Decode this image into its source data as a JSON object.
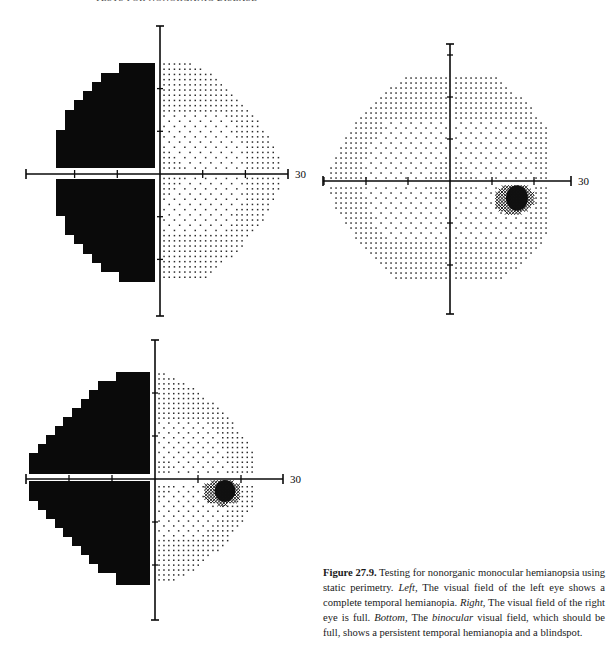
{
  "running_head": "TESTS FOR NONORGANIC DISEASE",
  "figure": {
    "number_label": "Figure 27.9.",
    "caption_parts": [
      {
        "text": " Testing for nonorganic monocular hemianopsia using static perimetry. ",
        "style": "normal"
      },
      {
        "text": "Left,",
        "style": "italic"
      },
      {
        "text": " The visual field of the left eye shows a complete temporal hemianopia. ",
        "style": "normal"
      },
      {
        "text": "Right,",
        "style": "italic"
      },
      {
        "text": " The visual field of the right eye is full. ",
        "style": "normal"
      },
      {
        "text": "Bottom,",
        "style": "italic"
      },
      {
        "text": " The ",
        "style": "normal"
      },
      {
        "text": "binocular",
        "style": "italic"
      },
      {
        "text": " visual field, which should be full, shows a persistent temporal hemianopia and a blindspot.",
        "style": "normal"
      }
    ]
  },
  "panels": [
    {
      "id": "left-eye",
      "title": "Left",
      "description": "Left eye visual field — complete temporal hemianopia",
      "center": [
        160,
        174
      ],
      "deg_px": 4.27,
      "axis_extent_px": {
        "left": 134,
        "right": 128,
        "top": 148,
        "bottom": 142
      },
      "axis_label": "30",
      "axis_label_pos": [
        295,
        178
      ],
      "ticks_deg": [
        -20,
        -10,
        10,
        20
      ],
      "defect": {
        "side": "left",
        "right_edge_x": 155,
        "upper_steps": [
          [
            63,
            73,
            119
          ],
          [
            73,
            82,
            101
          ],
          [
            82,
            91,
            92
          ],
          [
            91,
            100,
            83
          ],
          [
            100,
            110,
            74
          ],
          [
            110,
            130,
            65
          ],
          [
            130,
            168,
            56
          ]
        ],
        "lower_steps": [
          [
            179,
            216,
            56
          ],
          [
            216,
            235,
            65
          ],
          [
            235,
            244,
            74
          ],
          [
            244,
            254,
            83
          ],
          [
            254,
            263,
            92
          ],
          [
            263,
            272,
            101
          ],
          [
            272,
            282,
            119
          ]
        ]
      },
      "seeing_field": {
        "x_min": 164,
        "x_max": 282,
        "y_min": 64,
        "y_max": 280,
        "spacing": 5.2,
        "radius_px": 124
      },
      "blindspot": null
    },
    {
      "id": "right-eye",
      "title": "Right",
      "description": "Right eye visual field — full",
      "center": [
        450,
        181
      ],
      "deg_px": 4.2,
      "axis_extent_px": {
        "left": 127,
        "right": 121,
        "top": 137,
        "bottom": 133
      },
      "axis_label": "30",
      "axis_label_pos": [
        578,
        185
      ],
      "ticks_deg": [
        -30,
        -20,
        -10,
        10,
        20
      ],
      "defect": null,
      "seeing_field": {
        "x_min": 326,
        "x_max": 546,
        "y_min": 78,
        "y_max": 281,
        "spacing": 5.0,
        "radius_px": 124
      },
      "blindspot": {
        "cx": 514,
        "cy": 199,
        "rx": 20,
        "ry": 15
      }
    },
    {
      "id": "binocular",
      "title": "Bottom",
      "description": "Binocular visual field — persistent temporal hemianopia and blindspot",
      "center": [
        155,
        479
      ],
      "deg_px": 4.3,
      "axis_extent_px": {
        "left": 129,
        "right": 128,
        "top": 139,
        "bottom": 141
      },
      "axis_label": "30",
      "axis_label_pos": [
        290,
        483
      ],
      "ticks_deg": [
        -20,
        -10,
        10,
        20
      ],
      "defect": {
        "side": "left",
        "right_edge_x": 150,
        "upper_steps": [
          [
            372,
            381,
            116
          ],
          [
            381,
            390,
            98
          ],
          [
            390,
            399,
            89
          ],
          [
            399,
            408,
            81
          ],
          [
            408,
            417,
            72
          ],
          [
            417,
            426,
            63
          ],
          [
            426,
            435,
            55
          ],
          [
            435,
            444,
            46
          ],
          [
            444,
            453,
            38
          ],
          [
            453,
            474,
            29
          ]
        ],
        "lower_steps": [
          [
            481,
            501,
            29
          ],
          [
            501,
            510,
            38
          ],
          [
            510,
            519,
            46
          ],
          [
            519,
            528,
            55
          ],
          [
            528,
            537,
            63
          ],
          [
            537,
            546,
            72
          ],
          [
            546,
            555,
            81
          ],
          [
            555,
            564,
            89
          ],
          [
            564,
            573,
            98
          ],
          [
            573,
            585,
            116
          ]
        ]
      },
      "seeing_field": {
        "x_min": 159,
        "x_max": 255,
        "y_min": 374,
        "y_max": 583,
        "spacing": 4.9,
        "radius_px": 108
      },
      "blindspot": {
        "cx": 222,
        "cy": 492,
        "rx": 19,
        "ry": 13
      }
    }
  ],
  "colors": {
    "ink": "#0a0a0a",
    "dot": "#2a2a2a",
    "paper": "#ffffff"
  }
}
